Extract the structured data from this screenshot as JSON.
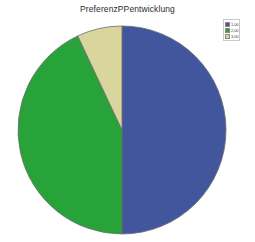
{
  "chart_data": {
    "type": "pie",
    "title": "PreferenzPPentwicklung",
    "xlabel": "",
    "ylabel": "",
    "categories": [
      "1,00",
      "2,00",
      "3,00"
    ],
    "values": [
      50,
      43,
      7
    ],
    "units": "percent",
    "colors": [
      "#42569E",
      "#28A33A",
      "#D9D69D"
    ],
    "slice_border_color": "#6b6b6b",
    "start_angle_deg": 0,
    "direction": "clockwise",
    "legend": {
      "position": "top-right",
      "entries": [
        {
          "label": "1,00",
          "color": "#42569E",
          "value": 50
        },
        {
          "label": "2,00",
          "color": "#28A33A",
          "value": 43
        },
        {
          "label": "3,00",
          "color": "#D9D69D",
          "value": 7
        }
      ]
    },
    "grid": false,
    "background_color": "#FFFFFF",
    "geometry": {
      "center_x": 122,
      "center_y": 130,
      "radius": 104
    }
  }
}
